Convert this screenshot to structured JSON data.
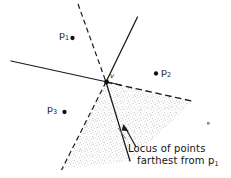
{
  "figure": {
    "kind": "geometry-line-diagram",
    "topic": "farthest-point locus / bisector arrangement",
    "background_color": "#ffffff",
    "ink_color": "#1a1a1a",
    "stipple_color": "#9a9a9a"
  },
  "points": [
    {
      "id": "p1",
      "label": "p",
      "sub": "1",
      "dot_side": "right",
      "x": 72,
      "y": 38
    },
    {
      "id": "p2",
      "label": "p",
      "sub": "2",
      "dot_side": "left",
      "x": 156,
      "y": 74
    },
    {
      "id": "p3",
      "label": "p",
      "sub": "3",
      "dot_side": "right",
      "x": 64,
      "y": 112
    }
  ],
  "vertex": {
    "id": "v",
    "label": "v",
    "x": 106,
    "y": 82
  },
  "caption": {
    "line1": "Locus of points",
    "line2": "farthest from p",
    "line2_sub": "1",
    "arrow": {
      "from_x": 136,
      "from_y": 146,
      "to_x": 124,
      "to_y": 126
    }
  },
  "lines": [
    {
      "id": "bisector-solid-west",
      "style": "solid",
      "x1": 11,
      "y1": 61,
      "x2": 120,
      "y2": 85
    },
    {
      "id": "bisector-solid-north-east",
      "style": "solid",
      "x1": 137,
      "y1": 17,
      "x2": 106,
      "y2": 82
    },
    {
      "id": "bisector-solid-south",
      "style": "solid",
      "x1": 106,
      "y1": 82,
      "x2": 130,
      "y2": 161
    },
    {
      "id": "bisector-dashed-north",
      "style": "dashed",
      "x1": 78,
      "y1": 4,
      "x2": 106,
      "y2": 82
    },
    {
      "id": "bisector-dashed-south-west",
      "style": "dashed",
      "x1": 106,
      "y1": 82,
      "x2": 62,
      "y2": 169
    },
    {
      "id": "bisector-dashed-east",
      "style": "dashed",
      "x1": 106,
      "y1": 82,
      "x2": 193,
      "y2": 101
    }
  ],
  "shaded_region": {
    "id": "farthest-locus-wedge",
    "fill": "stipple",
    "vertices": [
      [
        106,
        82
      ],
      [
        193,
        101
      ],
      [
        130,
        161
      ],
      [
        62,
        169
      ]
    ]
  },
  "stray_mark": {
    "x": 208,
    "y": 123
  }
}
